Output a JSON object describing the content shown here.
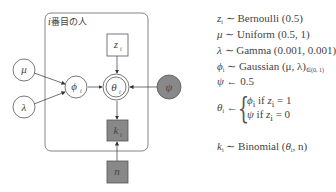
{
  "diagram": {
    "plate": {
      "label_var": "i",
      "label_text": "番目の人"
    },
    "nodes": {
      "mu": {
        "label": "μ",
        "sub": "",
        "shape": "circle",
        "observed": false
      },
      "lambda": {
        "label": "λ",
        "sub": "",
        "shape": "circle",
        "observed": false
      },
      "phi": {
        "label": "ϕ",
        "sub": "i",
        "shape": "circle",
        "observed": false
      },
      "theta": {
        "label": "θ",
        "sub": "i",
        "shape": "double-circle",
        "observed": false
      },
      "psi": {
        "label": "ψ",
        "sub": "",
        "shape": "circle",
        "observed": true
      },
      "z": {
        "label": "z",
        "sub": "i",
        "shape": "square",
        "observed": false
      },
      "k": {
        "label": "k",
        "sub": "i",
        "shape": "square",
        "observed": true
      },
      "n": {
        "label": "n",
        "sub": "",
        "shape": "square",
        "observed": true
      }
    },
    "edges": [
      [
        "mu",
        "phi"
      ],
      [
        "lambda",
        "phi"
      ],
      [
        "phi",
        "theta"
      ],
      [
        "psi",
        "theta"
      ],
      [
        "z",
        "theta"
      ],
      [
        "theta",
        "k"
      ],
      [
        "n",
        "k"
      ]
    ],
    "colors": {
      "observed_fill": "#888888",
      "stroke": "#555555"
    }
  },
  "equations": {
    "z": {
      "lhs": "z",
      "sub": "i",
      "op": "∼",
      "rhs": "Bernoulli (0.5)"
    },
    "mu": {
      "lhs": "μ",
      "op": "∼",
      "rhs": "Uniform (0.5, 1)"
    },
    "lambda": {
      "lhs": "λ",
      "op": "∼",
      "rhs": "Gamma (0.001, 0.001)"
    },
    "phi": {
      "lhs": "ϕ",
      "sub": "i",
      "op": "∼",
      "rhs": "Gaussian (μ, λ)",
      "rhs_sub": "∈(0, 1)"
    },
    "psi": {
      "lhs": "ψ",
      "op": "←",
      "rhs": "0.5"
    },
    "theta": {
      "lhs": "θ",
      "sub": "i",
      "op": "←",
      "case1": {
        "val": "ϕ",
        "val_sub": "i",
        "cond": "if",
        "cond_var": "z",
        "cond_sub": "i",
        "cond_val": "= 1"
      },
      "case2": {
        "val": "ψ",
        "cond": "if",
        "cond_var": "z",
        "cond_sub": "i",
        "cond_val": "= 0"
      }
    },
    "k": {
      "lhs": "k",
      "sub": "i",
      "op": "∼",
      "rhs_pre": "Binomial (",
      "rhs_var": "θ",
      "rhs_var_sub": "i",
      "rhs_post": ", n)"
    }
  }
}
